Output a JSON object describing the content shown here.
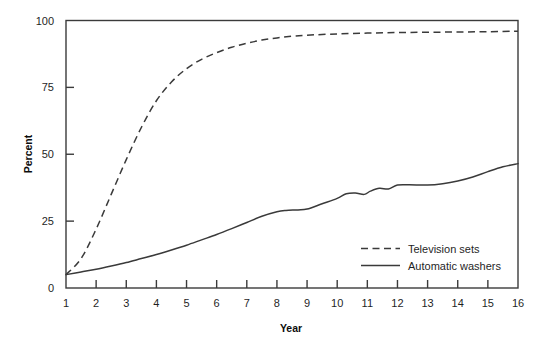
{
  "chart_data": {
    "type": "line",
    "title": "",
    "xlabel": "Year",
    "ylabel": "Percent",
    "xlim": [
      1,
      16
    ],
    "ylim": [
      0,
      100
    ],
    "grid": false,
    "legend_position": "inside-right-lower",
    "x_ticks": [
      "1",
      "2",
      "3",
      "4",
      "5",
      "6",
      "7",
      "8",
      "9",
      "10",
      "11",
      "12",
      "13",
      "14",
      "15",
      "16"
    ],
    "y_ticks": [
      "0",
      "25",
      "50",
      "75",
      "100"
    ],
    "x": [
      1,
      2,
      3,
      4,
      5,
      6,
      7,
      8,
      9,
      10,
      11,
      12,
      13,
      14,
      15,
      16
    ],
    "series": [
      {
        "name": "Television sets",
        "style": "dashed",
        "color": "#3a3a3a",
        "values": [
          5,
          22,
          48,
          70,
          82,
          88,
          91.5,
          93.5,
          94.5,
          95,
          95.3,
          95.5,
          95.6,
          95.7,
          95.8,
          96
        ]
      },
      {
        "name": "Automatic washers",
        "style": "solid",
        "color": "#3a3a3a",
        "values": [
          5,
          7,
          9.5,
          12.5,
          16,
          20,
          24.5,
          28.5,
          29.5,
          33.5,
          37,
          38.5,
          38.5,
          40,
          43.5,
          46.5
        ]
      }
    ],
    "detail_points": {
      "television_sets": [
        [
          1,
          5
        ],
        [
          1.5,
          11
        ],
        [
          2,
          22
        ],
        [
          2.5,
          35
        ],
        [
          3,
          48
        ],
        [
          3.5,
          60
        ],
        [
          4,
          70
        ],
        [
          4.5,
          77
        ],
        [
          5,
          82
        ],
        [
          5.5,
          85.5
        ],
        [
          6,
          88
        ],
        [
          6.5,
          90
        ],
        [
          7,
          91.5
        ],
        [
          7.5,
          92.7
        ],
        [
          8,
          93.5
        ],
        [
          8.5,
          94.1
        ],
        [
          9,
          94.5
        ],
        [
          10,
          95
        ],
        [
          11,
          95.3
        ],
        [
          12,
          95.5
        ],
        [
          13,
          95.6
        ],
        [
          14,
          95.7
        ],
        [
          15,
          95.8
        ],
        [
          16,
          96
        ]
      ],
      "automatic_washers": [
        [
          1,
          5
        ],
        [
          1.5,
          6
        ],
        [
          2,
          7
        ],
        [
          2.5,
          8.2
        ],
        [
          3,
          9.5
        ],
        [
          3.5,
          11
        ],
        [
          4,
          12.5
        ],
        [
          4.5,
          14.2
        ],
        [
          5,
          16
        ],
        [
          5.5,
          18
        ],
        [
          6,
          20
        ],
        [
          6.5,
          22.2
        ],
        [
          7,
          24.5
        ],
        [
          7.5,
          26.8
        ],
        [
          8,
          28.5
        ],
        [
          8.3,
          29
        ],
        [
          8.7,
          29.2
        ],
        [
          9,
          29.5
        ],
        [
          9.5,
          31.5
        ],
        [
          10,
          33.5
        ],
        [
          10.3,
          35.2
        ],
        [
          10.6,
          35.5
        ],
        [
          10.9,
          35
        ],
        [
          11.1,
          36.2
        ],
        [
          11.4,
          37.3
        ],
        [
          11.7,
          37
        ],
        [
          12,
          38.5
        ],
        [
          12.4,
          38.6
        ],
        [
          13,
          38.5
        ],
        [
          13.5,
          39
        ],
        [
          14,
          40
        ],
        [
          14.5,
          41.5
        ],
        [
          15,
          43.5
        ],
        [
          15.5,
          45.3
        ],
        [
          16,
          46.5
        ]
      ]
    }
  },
  "legend": {
    "items": [
      {
        "label": "Television sets",
        "style": "dashed"
      },
      {
        "label": "Automatic washers",
        "style": "solid"
      }
    ]
  },
  "axes": {
    "y_title": "Percent",
    "x_title": "Year"
  }
}
